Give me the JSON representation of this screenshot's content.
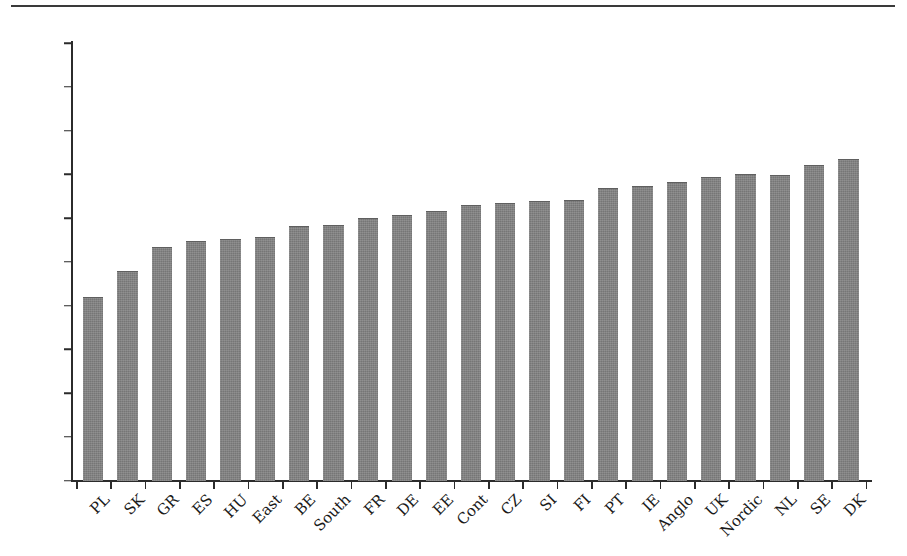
{
  "chart_data": {
    "type": "bar",
    "title": "",
    "subtitle": "",
    "xlabel": "",
    "ylabel": "",
    "ylim": [
      0,
      100
    ],
    "yticks": [
      0,
      10,
      20,
      30,
      40,
      50,
      60,
      70,
      80,
      90,
      100
    ],
    "grid": false,
    "legend": null,
    "bar_color": "#767676",
    "axis_color": "#2b2b2b",
    "categories": [
      "PL",
      "SK",
      "GR",
      "ES",
      "HU",
      "East",
      "BE",
      "South",
      "FR",
      "DE",
      "EE",
      "Cont",
      "CZ",
      "SI",
      "FI",
      "PT",
      "IE",
      "Anglo",
      "UK",
      "Nordic",
      "NL",
      "SE",
      "DK"
    ],
    "values": [
      41.9,
      47.8,
      53.3,
      54.8,
      55.3,
      55.7,
      58.2,
      58.4,
      60.1,
      60.7,
      61.6,
      63.0,
      63.5,
      64.0,
      64.2,
      66.9,
      67.3,
      68.2,
      69.3,
      70.0,
      69.9,
      72.1,
      73.5
    ]
  },
  "figure": {
    "top_rule": "horizontal-rule"
  }
}
